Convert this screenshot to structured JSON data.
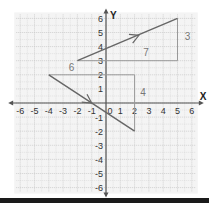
{
  "chart_data": {
    "type": "line",
    "title": "",
    "xlabel": "X",
    "ylabel": "Y",
    "xlim": [
      -6,
      6
    ],
    "ylim": [
      -6,
      6
    ],
    "grid": true,
    "x_ticks": [
      -6,
      -5,
      -4,
      -3,
      -2,
      -1,
      0,
      1,
      2,
      3,
      4,
      5,
      6
    ],
    "y_ticks": [
      -6,
      -5,
      -4,
      -3,
      -2,
      -1,
      0,
      1,
      2,
      3,
      4,
      5,
      6
    ],
    "series": [
      {
        "name": "line-positive-slope",
        "points": [
          [
            -2,
            3
          ],
          [
            5,
            6
          ]
        ],
        "arrow_at": [
          2.3,
          4.8
        ],
        "slope_triangle": {
          "run": 7,
          "rise": 3,
          "corner": [
            5,
            3
          ]
        }
      },
      {
        "name": "line-negative-slope",
        "points": [
          [
            -4,
            2
          ],
          [
            2,
            -2
          ]
        ],
        "arrow_at": [
          -1,
          0
        ],
        "slope_triangle": {
          "run": 6,
          "rise": -4,
          "corner": [
            2,
            2
          ]
        }
      }
    ],
    "annotations": [
      {
        "text": "7",
        "x": 2.6,
        "y": 3.3
      },
      {
        "text": "3",
        "x": 5.5,
        "y": 4.5
      },
      {
        "text": "6",
        "x": -2.6,
        "y": 2.3
      },
      {
        "text": "4",
        "x": 2.4,
        "y": 0.5
      }
    ]
  },
  "labels": {
    "x_axis": "X",
    "y_axis": "Y",
    "x_ticks": [
      "-6",
      "-5",
      "-4",
      "-3",
      "-2",
      "-1",
      "0",
      "1",
      "2",
      "3",
      "4",
      "5",
      "6"
    ],
    "y_ticks": [
      "6",
      "5",
      "4",
      "3",
      "2",
      "1",
      "-1",
      "-2",
      "-3",
      "-4",
      "-5",
      "-6"
    ],
    "run_a": "7",
    "rise_a": "3",
    "run_b": "6",
    "rise_b": "4"
  },
  "colors": {
    "grid": "#c8c8c8",
    "axis": "#555555",
    "line": "#666666",
    "triangle": "#999999",
    "label": "#777777"
  }
}
